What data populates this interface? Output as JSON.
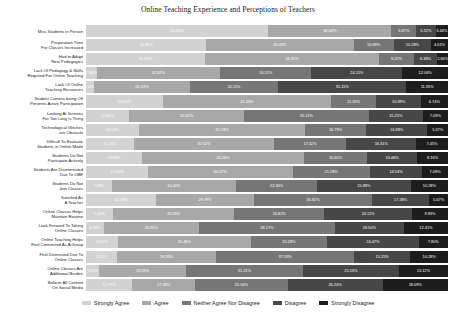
{
  "chart_data": {
    "type": "bar",
    "subtype": "stacked-horizontal-100pct",
    "title": "Online Teaching Experience and Perceptions of Teachers",
    "xlabel": "",
    "ylabel": "",
    "xlim": [
      0,
      100
    ],
    "grid": false,
    "legend_position": "bottom",
    "unit": "%",
    "legend": [
      "Strongly Agree",
      "Agree",
      "Neither Agree Nor Disagree",
      "Disagree",
      "Strongly Disagree"
    ],
    "colors": [
      "#d2d2d2",
      "#a8a8a8",
      "#767676",
      "#474747",
      "#1d1d1d"
    ],
    "categories": [
      "Miss Students in Person",
      "Preparation Time\nFor Classes Increased",
      "Had to Adopt\nNew Pedagogies",
      "Lack Of Pedagogy & Skills\nRequired For Online Teaching",
      "Lack Of Online\nTeaching Resources",
      "Student Camera being Off\nPrevents Active Participation",
      "Looking At Screens\nFor Too Long Is Tiring",
      "Technological Glitches\nare Obstacle",
      "Difficult To Evaluate\nStudents in Online Mode",
      "Students Do Not\nParticipate Actively",
      "Students Are Disinterested\nDue To OBE",
      "Students Do Not\nJoin Classes",
      "Satisfied As\nA Teacher",
      "Online Classes Helps\nMaintain Routine",
      "Look Forward To Taking\nOnline Classes",
      "Online Teaching Helps\nFeel Connected As A Group",
      "Feel Distressed Due To\nOnline Classes",
      "Online Classes Are\nAdditional Burden",
      "Believe All Content\nOn Social Media"
    ],
    "series": [
      {
        "name": "Strongly Agree",
        "values": [
          50.35,
          32.98,
          31.91,
          2.84,
          2.13,
          19.15,
          12.06,
          14.54,
          11.35,
          14.89,
          17.02,
          7.09,
          21.28,
          7.45,
          4.96,
          8.51,
          8.51,
          3.55,
          12.77
        ]
      },
      {
        "name": "Agree",
        "values": [
          34.04,
          40.43,
          46.81,
          32.62,
          26.24,
          41.49,
          32.62,
          45.74,
          32.62,
          43.26,
          40.07,
          34.4,
          29.79,
          33.33,
          26.95,
          35.46,
          26.95,
          23.05,
          17.38
        ]
      },
      {
        "name": "Neither Agree Nor Disagree",
        "values": [
          6.87,
          10.99,
          9.22,
          24.11,
          24.11,
          11.35,
          35.11,
          16.79,
          17.02,
          16.6,
          21.28,
          22.34,
          35.82,
          24.82,
          38.17,
          20.28,
          37.59,
          31.21,
          25.53
        ]
      },
      {
        "name": "Disagree",
        "values": [
          5.32,
          10.28,
          6.38,
          24.11,
          35.11,
          10.99,
          15.25,
          16.89,
          16.31,
          13.48,
          14.54,
          25.89,
          17.38,
          24.11,
          19.5,
          24.47,
          15.25,
          25.53,
          26.24
        ]
      },
      {
        "name": "Strongly Disagree",
        "values": [
          3.44,
          4.61,
          2.84,
          12.06,
          11.35,
          6.74,
          7.09,
          5.67,
          7.45,
          8.16,
          7.09,
          10.28,
          5.67,
          9.93,
          12.41,
          7.8,
          10.28,
          13.12,
          18.09
        ]
      }
    ],
    "labels": [
      [
        "50.35%",
        "34.04%",
        "6.87%",
        "5.32%",
        "3.44%"
      ],
      [
        "32.98%",
        "40.43%",
        "10.99%",
        "10.28%",
        "4.61%"
      ],
      [
        "31.91%",
        "46.81%",
        "9.22%",
        "6.38%",
        "2.84%"
      ],
      [
        "2.84%",
        "32.62%",
        "24.11%",
        "24.11%",
        "12.06%"
      ],
      [
        "2.13%",
        "26.24%",
        "24.11%",
        "35.11%",
        "11.35%"
      ],
      [
        "19.15%",
        "41.49%",
        "11.35%",
        "10.99%",
        "6.74%"
      ],
      [
        "12.06%",
        "32.62%",
        "35.11%",
        "15.25%",
        "7.09%"
      ],
      [
        "14.54%",
        "45.74%",
        "16.79%",
        "16.89%",
        "5.67%"
      ],
      [
        "11.35%",
        "32.62%",
        "17.02%",
        "16.31%",
        "7.45%"
      ],
      [
        "14.89%",
        "43.26%",
        "16.60%",
        "13.48%",
        "8.16%"
      ],
      [
        "17.02%",
        "40.07%",
        "21.28%",
        "14.54%",
        "7.09%"
      ],
      [
        "7.09%",
        "34.40%",
        "22.34%",
        "25.89%",
        "10.28%"
      ],
      [
        "21.28%",
        "29.79%",
        "35.82%",
        "17.38%",
        "5.67%"
      ],
      [
        "7.45%",
        "33.33%",
        "24.82%",
        "24.11%",
        "9.93%"
      ],
      [
        "4.96%",
        "26.95%",
        "38.17%",
        "19.50%",
        "12.41%"
      ],
      [
        "8.51%",
        "35.46%",
        "20.28%",
        "24.47%",
        "7.80%"
      ],
      [
        "8.51%",
        "26.95%",
        "37.59%",
        "15.25%",
        "10.28%"
      ],
      [
        "3.55%",
        "23.05%",
        "31.21%",
        "25.53%",
        "13.12%"
      ],
      [
        "12.77%",
        "17.38%",
        "25.53%",
        "26.24%",
        "18.09%"
      ]
    ]
  }
}
